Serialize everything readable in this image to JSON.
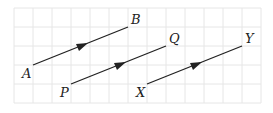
{
  "diagram": {
    "grid": {
      "x0": 14,
      "y0": 8,
      "cell": 19,
      "cols": 13,
      "rows": 5,
      "color": "#e4e4e4"
    },
    "line_color": "#222222",
    "vectors": [
      {
        "start_label": "A",
        "end_label": "B",
        "start": [
          33,
          65
        ],
        "end": [
          128,
          27
        ]
      },
      {
        "start_label": "P",
        "end_label": "Q",
        "start": [
          71,
          84
        ],
        "end": [
          166,
          46
        ]
      },
      {
        "start_label": "X",
        "end_label": "Y",
        "start": [
          147,
          84
        ],
        "end": [
          242,
          46
        ]
      }
    ]
  }
}
